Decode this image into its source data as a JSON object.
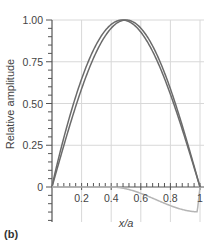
{
  "panel_label": "(b)",
  "chart_data": {
    "type": "line",
    "title": "",
    "xlabel": "x/a",
    "ylabel": "Relative amplitude",
    "xlim": [
      0,
      1
    ],
    "ylim": [
      -0.2,
      1.0
    ],
    "x_ticks": [
      0.2,
      0.4,
      0.6,
      0.8,
      1
    ],
    "x_tick_labels": [
      "0.2",
      "0.4",
      "0.6",
      "0.8",
      "1"
    ],
    "y_ticks": [
      0,
      0.25,
      0.5,
      0.75,
      1.0
    ],
    "y_tick_labels": [
      "0",
      "0.25",
      "0.50",
      "0.75",
      "1.00"
    ],
    "grid": true,
    "legend": null,
    "x": [
      0,
      0.1,
      0.2,
      0.3,
      0.4,
      0.5,
      0.6,
      0.7,
      0.8,
      0.9,
      1.0
    ],
    "series": [
      {
        "name": "curve-1",
        "color": "#6b6b6b",
        "values": [
          0,
          0.31,
          0.59,
          0.81,
          0.95,
          1.0,
          0.95,
          0.81,
          0.59,
          0.31,
          0
        ]
      },
      {
        "name": "curve-2",
        "color": "#6b6b6b",
        "values": [
          0,
          0.27,
          0.53,
          0.76,
          0.92,
          0.995,
          0.98,
          0.86,
          0.64,
          0.35,
          0
        ]
      },
      {
        "name": "difference",
        "color": "#b5b5b5",
        "values": [
          0,
          0,
          0,
          0,
          0,
          -0.01,
          -0.04,
          -0.09,
          -0.15,
          -0.15,
          0
        ]
      }
    ]
  }
}
